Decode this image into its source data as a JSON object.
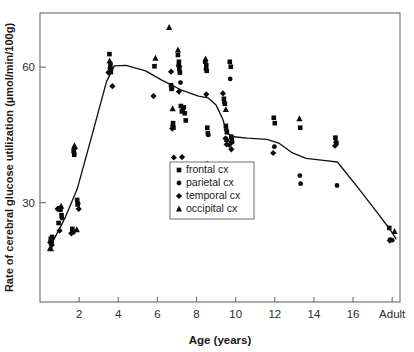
{
  "figure": {
    "background": "#ffffff",
    "ink_color": "#111111",
    "frame_color": "#6a6a6a"
  },
  "chart_data": {
    "type": "scatter",
    "title": "",
    "xlabel": "Age (years)",
    "ylabel": "Rate of cerebral glucose utilization (µmol/min/100g)",
    "xlim": [
      0,
      18.4
    ],
    "ylim": [
      8,
      72
    ],
    "grid": false,
    "xticks": [
      2,
      4,
      6,
      8,
      10,
      12,
      14,
      16,
      18
    ],
    "xticklabels": [
      "2",
      "4",
      "6",
      "8",
      "10",
      "12",
      "14",
      "16",
      "Adult"
    ],
    "yticks": [
      30,
      60
    ],
    "yticklabels": [
      "30",
      "60"
    ],
    "legend_position": "center",
    "legend_entries": [
      {
        "label": "frontal cx",
        "marker": "square"
      },
      {
        "label": "parietal cx",
        "marker": "circle"
      },
      {
        "label": "temporal cx",
        "marker": "diamond"
      },
      {
        "label": "occipital cx",
        "marker": "triangle"
      }
    ],
    "series": [
      {
        "name": "frontal cx",
        "marker": "square",
        "points": [
          [
            0.55,
            22.0
          ],
          [
            0.6,
            21.6
          ],
          [
            0.62,
            22.4
          ],
          [
            0.95,
            25.5
          ],
          [
            1.05,
            28.4
          ],
          [
            1.1,
            27.2
          ],
          [
            1.65,
            24.2
          ],
          [
            1.68,
            23.6
          ],
          [
            1.72,
            41.5
          ],
          [
            1.75,
            40.6
          ],
          [
            1.9,
            30.6
          ],
          [
            1.92,
            29.6
          ],
          [
            3.55,
            62.9
          ],
          [
            3.6,
            60.6
          ],
          [
            3.6,
            59.4
          ],
          [
            3.62,
            58.9
          ],
          [
            5.85,
            60.2
          ],
          [
            6.7,
            56.0
          ],
          [
            6.72,
            55.2
          ],
          [
            6.8,
            47.6
          ],
          [
            6.82,
            46.6
          ],
          [
            7.05,
            62.7
          ],
          [
            7.1,
            61.2
          ],
          [
            7.12,
            59.6
          ],
          [
            7.15,
            58.8
          ],
          [
            7.2,
            51.4
          ],
          [
            7.25,
            50.2
          ],
          [
            7.35,
            51.1
          ],
          [
            7.4,
            49.8
          ],
          [
            7.45,
            48.2
          ],
          [
            8.45,
            61.2
          ],
          [
            8.5,
            60.4
          ],
          [
            8.52,
            59.2
          ],
          [
            8.55,
            46.6
          ],
          [
            8.58,
            45.4
          ],
          [
            9.4,
            53.0
          ],
          [
            9.45,
            51.9
          ],
          [
            9.5,
            47.0
          ],
          [
            9.55,
            45.6
          ],
          [
            9.7,
            61.2
          ],
          [
            9.75,
            60.1
          ],
          [
            9.78,
            44.6
          ],
          [
            9.8,
            43.8
          ],
          [
            11.95,
            48.8
          ],
          [
            12.0,
            47.6
          ],
          [
            13.3,
            46.6
          ],
          [
            15.1,
            44.4
          ],
          [
            15.15,
            43.2
          ],
          [
            17.85,
            24.4
          ]
        ]
      },
      {
        "name": "parietal cx",
        "marker": "circle",
        "points": [
          [
            0.55,
            21.4
          ],
          [
            0.58,
            21.0
          ],
          [
            0.98,
            28.8
          ],
          [
            1.12,
            26.6
          ],
          [
            1.7,
            23.4
          ],
          [
            1.74,
            41.0
          ],
          [
            1.95,
            29.8
          ],
          [
            3.58,
            59.8
          ],
          [
            3.62,
            59.2
          ],
          [
            6.75,
            55.4
          ],
          [
            6.78,
            47.0
          ],
          [
            7.08,
            60.4
          ],
          [
            7.18,
            56.6
          ],
          [
            7.3,
            50.6
          ],
          [
            8.48,
            59.6
          ],
          [
            8.6,
            45.0
          ],
          [
            9.42,
            52.2
          ],
          [
            9.52,
            46.2
          ],
          [
            9.72,
            57.4
          ],
          [
            9.82,
            43.4
          ],
          [
            11.98,
            42.4
          ],
          [
            13.28,
            36.0
          ],
          [
            13.32,
            34.2
          ],
          [
            15.12,
            43.4
          ],
          [
            15.18,
            33.8
          ],
          [
            17.9,
            21.8
          ],
          [
            18.0,
            21.7
          ]
        ]
      },
      {
        "name": "temporal cx",
        "marker": "diamond",
        "points": [
          [
            0.52,
            21.2
          ],
          [
            0.6,
            20.6
          ],
          [
            0.9,
            28.6
          ],
          [
            1.0,
            23.8
          ],
          [
            1.6,
            23.2
          ],
          [
            1.78,
            42.0
          ],
          [
            1.98,
            28.6
          ],
          [
            3.5,
            58.8
          ],
          [
            3.55,
            59.0
          ],
          [
            3.7,
            55.8
          ],
          [
            5.8,
            53.6
          ],
          [
            6.7,
            59.0
          ],
          [
            6.76,
            46.4
          ],
          [
            6.84,
            40.0
          ],
          [
            7.1,
            54.6
          ],
          [
            7.26,
            40.1
          ],
          [
            8.5,
            54.0
          ],
          [
            8.55,
            38.6
          ],
          [
            9.35,
            54.2
          ],
          [
            9.48,
            44.2
          ],
          [
            9.54,
            42.9
          ],
          [
            9.68,
            42.8
          ],
          [
            9.78,
            41.8
          ],
          [
            11.92,
            41.0
          ],
          [
            15.08,
            42.6
          ],
          [
            17.88,
            21.6
          ]
        ]
      },
      {
        "name": "occipital cx",
        "marker": "triangle",
        "points": [
          [
            0.56,
            19.8
          ],
          [
            1.08,
            29.2
          ],
          [
            1.76,
            42.6
          ],
          [
            1.88,
            24.0
          ],
          [
            3.56,
            61.4
          ],
          [
            3.6,
            60.2
          ],
          [
            5.9,
            62.0
          ],
          [
            6.6,
            68.8
          ],
          [
            6.78,
            50.8
          ],
          [
            7.05,
            63.8
          ],
          [
            7.12,
            60.6
          ],
          [
            8.46,
            61.8
          ],
          [
            9.5,
            50.6
          ],
          [
            9.56,
            44.0
          ],
          [
            13.26,
            48.6
          ],
          [
            18.12,
            23.6
          ]
        ]
      }
    ],
    "trend_line": {
      "name": "mean developmental curve",
      "points": [
        [
          0.4,
          19.4
        ],
        [
          0.8,
          22.6
        ],
        [
          1.3,
          26.8
        ],
        [
          1.9,
          33.0
        ],
        [
          2.6,
          44.0
        ],
        [
          3.4,
          56.8
        ],
        [
          3.8,
          60.3
        ],
        [
          4.4,
          60.4
        ],
        [
          5.4,
          59.2
        ],
        [
          6.2,
          57.2
        ],
        [
          7.2,
          55.0
        ],
        [
          8.1,
          53.6
        ],
        [
          8.6,
          53.2
        ],
        [
          9.0,
          51.6
        ],
        [
          9.35,
          48.4
        ],
        [
          9.55,
          45.4
        ],
        [
          9.9,
          44.6
        ],
        [
          10.6,
          44.3
        ],
        [
          11.6,
          44.0
        ],
        [
          12.2,
          43.2
        ],
        [
          12.9,
          41.0
        ],
        [
          13.6,
          39.8
        ],
        [
          14.6,
          39.3
        ],
        [
          15.2,
          39.0
        ],
        [
          16.2,
          33.6
        ],
        [
          17.2,
          28.0
        ],
        [
          17.9,
          24.0
        ],
        [
          18.2,
          22.0
        ]
      ]
    }
  }
}
